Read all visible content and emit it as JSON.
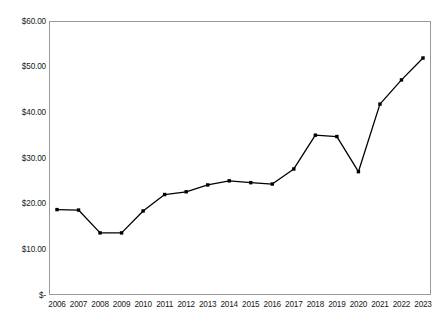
{
  "chart_data": {
    "type": "line",
    "title": "",
    "subtitle": "",
    "xlabel": "",
    "ylabel": "",
    "categories": [
      "2006",
      "2007",
      "2008",
      "2009",
      "2010",
      "2011",
      "2012",
      "2013",
      "2014",
      "2015",
      "2016",
      "2017",
      "2018",
      "2019",
      "2020",
      "2021",
      "2022",
      "2023"
    ],
    "values": [
      18.7,
      18.6,
      13.6,
      13.6,
      18.4,
      22.0,
      22.6,
      24.1,
      25.0,
      24.6,
      24.3,
      27.6,
      35.0,
      34.7,
      27.0,
      41.8,
      47.1,
      51.9
    ],
    "series": [
      {
        "name": "",
        "values": [
          18.7,
          18.6,
          13.6,
          13.6,
          18.4,
          22.0,
          22.6,
          24.1,
          25.0,
          24.6,
          24.3,
          27.6,
          35.0,
          34.7,
          27.0,
          41.8,
          47.1,
          51.9
        ]
      }
    ],
    "ylim": [
      0,
      60
    ],
    "ytick_values": [
      0,
      10,
      20,
      30,
      40,
      50,
      60
    ],
    "ytick_labels": [
      "$-",
      "$10.00",
      "$20.00",
      "$30.00",
      "$40.00",
      "$50.00",
      "$60.00"
    ],
    "xtick_labels": [
      "2006",
      "2007",
      "2008",
      "2009",
      "2010",
      "2011",
      "2012",
      "2013",
      "2014",
      "2015",
      "2016",
      "2017",
      "2018",
      "2019",
      "2020",
      "2021",
      "2022",
      "2023"
    ],
    "grid": false,
    "legend": false,
    "legend_position": "none",
    "annotations": [],
    "markers": "square",
    "line_color": "#000000",
    "marker_color": "#000000",
    "plot_background": "#ffffff",
    "frame_color": "#9a9a9a"
  }
}
